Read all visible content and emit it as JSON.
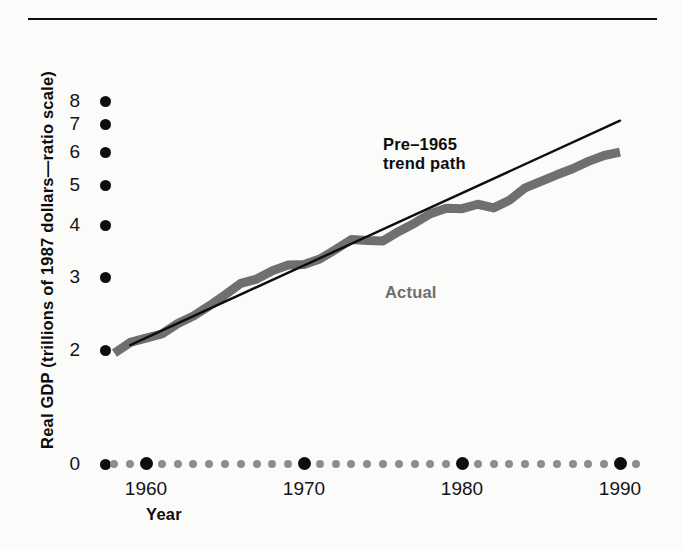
{
  "figure": {
    "background_color": "#fbfbfa",
    "rule_color": "#0d0d0d",
    "actual_color": "#6f6f6f",
    "trend_color": "#0d0d0d"
  },
  "axis": {
    "y_title": "Real GDP (trillions of 1987 dollars—ratio scale)",
    "x_title": "Year",
    "y_ticks": [
      {
        "label": "8",
        "value": 8
      },
      {
        "label": "7",
        "value": 7
      },
      {
        "label": "6",
        "value": 6
      },
      {
        "label": "5",
        "value": 5
      },
      {
        "label": "4",
        "value": 4
      },
      {
        "label": "3",
        "value": 3
      },
      {
        "label": "2",
        "value": 2
      },
      {
        "label": "0",
        "value": 0
      }
    ],
    "x_tick_labels": [
      "1960",
      "1970",
      "1980",
      "1990"
    ]
  },
  "annotations": {
    "trend_label_line1": "Pre–1965",
    "trend_label_line2": "trend path",
    "actual_label": "Actual"
  },
  "chart_data": {
    "type": "line",
    "title": "",
    "subtitle": "",
    "xlabel": "Year",
    "ylabel": "Real GDP (trillions of 1987 dollars—ratio scale)",
    "yscale": "log",
    "ylim": [
      2,
      8
    ],
    "xlim": [
      1957,
      1991
    ],
    "grid": false,
    "legend": "inline annotations",
    "ytick_values": [
      2,
      3,
      4,
      5,
      6,
      7,
      8
    ],
    "xtick_values": [
      1960,
      1970,
      1980,
      1990
    ],
    "series": [
      {
        "name": "Actual",
        "color": "#6f6f6f",
        "style": "thick-band",
        "x": [
          1958,
          1959,
          1960,
          1961,
          1962,
          1963,
          1964,
          1965,
          1966,
          1967,
          1968,
          1969,
          1970,
          1971,
          1972,
          1973,
          1974,
          1975,
          1976,
          1977,
          1978,
          1979,
          1980,
          1981,
          1982,
          1983,
          1984,
          1985,
          1986,
          1987,
          1988,
          1989,
          1990
        ],
        "values": [
          1.96,
          2.08,
          2.13,
          2.18,
          2.31,
          2.41,
          2.55,
          2.71,
          2.89,
          2.96,
          3.1,
          3.2,
          3.21,
          3.31,
          3.49,
          3.69,
          3.67,
          3.66,
          3.86,
          4.04,
          4.26,
          4.39,
          4.38,
          4.49,
          4.4,
          4.59,
          4.92,
          5.1,
          5.29,
          5.47,
          5.7,
          5.89,
          6.0
        ],
        "values_plot_scale": [
          1.96,
          2.08,
          2.13,
          2.18,
          2.31,
          2.41,
          2.55,
          2.71,
          2.89,
          2.96,
          3.1,
          3.2,
          3.21,
          3.31,
          3.49,
          3.69,
          3.67,
          3.66,
          3.86,
          4.04,
          4.26,
          4.39,
          4.38,
          4.49,
          4.4,
          4.59,
          4.92,
          5.1,
          5.29,
          5.47,
          5.7,
          5.89,
          6.0
        ],
        "notes": "Actual real GDP; plateaus visible at 1974-75, 1980-82 recessions"
      },
      {
        "name": "Pre-1965 trend path",
        "color": "#0d0d0d",
        "style": "thin-line",
        "x": [
          1959,
          1990
        ],
        "values": [
          2.05,
          7.15
        ],
        "notes": "Straight line on ratio (log) scale extrapolating pre-1965 growth trend"
      }
    ],
    "annotations": [
      {
        "text": "Pre–1965 trend path",
        "x": 1969,
        "y": 5.6
      },
      {
        "text": "Actual",
        "x": 1969,
        "y": 2.85
      }
    ]
  }
}
